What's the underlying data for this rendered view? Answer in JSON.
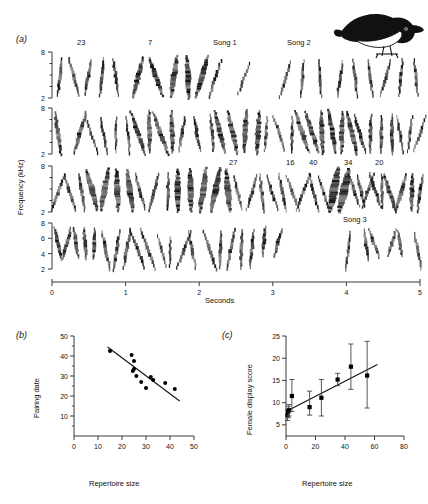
{
  "figure": {
    "panels": [
      {
        "key": "a",
        "label": "(a)"
      },
      {
        "key": "b",
        "label": "(b)"
      },
      {
        "key": "c",
        "label": "(c)"
      }
    ]
  },
  "panel_a": {
    "label": "(a)",
    "ylabel": "Frequency (kHz)",
    "xlabel": "Seconds",
    "x_ticks": [
      "0",
      "1",
      "2",
      "3",
      "4",
      "5"
    ],
    "xlim": [
      0,
      5
    ],
    "rows": [
      {
        "index": 1,
        "y_ticks": [
          "2",
          "8"
        ],
        "ylim": [
          2,
          8
        ]
      },
      {
        "index": 2,
        "y_ticks": [
          "2",
          "8"
        ],
        "ylim": [
          2,
          8
        ]
      },
      {
        "index": 3,
        "y_ticks": [
          "2",
          "8"
        ],
        "ylim": [
          2,
          8
        ]
      },
      {
        "index": 4,
        "y_ticks": [
          "2",
          "4",
          "6",
          "8"
        ],
        "ylim": [
          2,
          8
        ]
      }
    ],
    "song_labels_row1": [
      {
        "text": "23",
        "x": 83
      },
      {
        "text": "7",
        "x": 152
      },
      {
        "text": "Song 1",
        "x": 228
      },
      {
        "text": "Song 2",
        "x": 301
      }
    ],
    "song_labels_row3": [
      {
        "text": "27",
        "x": 233
      },
      {
        "text": "16",
        "x": 290
      },
      {
        "text": "40",
        "x": 313
      },
      {
        "text": "34",
        "x": 348
      },
      {
        "text": "20",
        "x": 379
      }
    ],
    "song_labels_row4": [
      {
        "text": "Song 3",
        "x": 350
      }
    ],
    "bird_icon": "perched-warbler-illustration"
  },
  "chart_data": [
    {
      "id": "panel_a_sonogram",
      "type": "heatmap",
      "title": "",
      "panel": "(a)",
      "xlabel": "Seconds",
      "ylabel": "Frequency (kHz)",
      "xlim": [
        0,
        5
      ],
      "ylim": [
        2,
        8
      ],
      "x_ticks": [
        0,
        1,
        2,
        3,
        4,
        5
      ],
      "y_ticks": [
        2,
        8
      ],
      "grid": false,
      "legend": "none",
      "description": "Four-row sonogram (spectrogram) strip of a continuously singing male warbler; each tick mark is one song syllable/element between 2 and 8 kHz.",
      "annotations": [
        {
          "row": 1,
          "text": "23"
        },
        {
          "row": 1,
          "text": "7"
        },
        {
          "row": 1,
          "text": "Song 1"
        },
        {
          "row": 1,
          "text": "Song 2"
        },
        {
          "row": 3,
          "text": "27"
        },
        {
          "row": 3,
          "text": "16"
        },
        {
          "row": 3,
          "text": "40"
        },
        {
          "row": 3,
          "text": "34"
        },
        {
          "row": 3,
          "text": "20"
        },
        {
          "row": 4,
          "text": "Song 3"
        }
      ]
    },
    {
      "id": "panel_b_pairing_date",
      "type": "scatter",
      "panel": "(b)",
      "title": "",
      "xlabel": "Repertoire size",
      "ylabel": "Pairing date",
      "xlim": [
        0,
        50
      ],
      "ylim": [
        0,
        50
      ],
      "x_ticks": [
        0,
        10,
        20,
        30,
        40,
        50
      ],
      "y_ticks": [
        10,
        20,
        30,
        40,
        50
      ],
      "grid": false,
      "legend": "none",
      "points": [
        {
          "x": 15,
          "y": 42.5
        },
        {
          "x": 24,
          "y": 40.5
        },
        {
          "x": 25,
          "y": 37.5
        },
        {
          "x": 25,
          "y": 33.5
        },
        {
          "x": 24.5,
          "y": 32.5
        },
        {
          "x": 26,
          "y": 30
        },
        {
          "x": 28,
          "y": 27
        },
        {
          "x": 30,
          "y": 24
        },
        {
          "x": 32,
          "y": 29.5
        },
        {
          "x": 33,
          "y": 28
        },
        {
          "x": 38,
          "y": 26.5
        },
        {
          "x": 42,
          "y": 23.5
        }
      ],
      "trendline": {
        "x": [
          14,
          44
        ],
        "y": [
          44.5,
          17.5
        ],
        "direction": "negative"
      }
    },
    {
      "id": "panel_c_female_display",
      "type": "scatter",
      "panel": "(c)",
      "title": "",
      "xlabel": "Repertoire size",
      "ylabel": "Female display score",
      "xlim": [
        0,
        80
      ],
      "ylim": [
        2.5,
        25
      ],
      "x_ticks": [
        0,
        20,
        40,
        60,
        80
      ],
      "y_ticks": [
        5,
        10,
        15,
        20,
        25
      ],
      "grid": false,
      "legend": "none",
      "error_bars": "vertical",
      "points": [
        {
          "x": 1,
          "y": 7.2,
          "err_low": 6.0,
          "err_high": 8.4
        },
        {
          "x": 1.5,
          "y": 8.0,
          "err_low": 6.6,
          "err_high": 9.2
        },
        {
          "x": 2,
          "y": 8.3,
          "err_low": 7.0,
          "err_high": 9.6
        },
        {
          "x": 4,
          "y": 11.5,
          "err_low": 8.0,
          "err_high": 15.2
        },
        {
          "x": 16,
          "y": 9.0,
          "err_low": 7.2,
          "err_high": 12.6
        },
        {
          "x": 24,
          "y": 11.1,
          "err_low": 7.0,
          "err_high": 15.2
        },
        {
          "x": 35,
          "y": 15.2,
          "err_low": 13.8,
          "err_high": 16.6
        },
        {
          "x": 44,
          "y": 18.1,
          "err_low": 13.0,
          "err_high": 23.2
        },
        {
          "x": 55,
          "y": 16.1,
          "err_low": 8.8,
          "err_high": 23.8
        }
      ],
      "trendline": {
        "x": [
          0,
          62
        ],
        "y": [
          8.0,
          18.6
        ],
        "direction": "positive"
      }
    }
  ],
  "panel_b": {
    "label": "(b)",
    "xlabel": "Repertoire size",
    "ylabel": "Pairing date"
  },
  "panel_c": {
    "label": "(c)",
    "xlabel": "Repertoire size",
    "ylabel": "Female display score"
  },
  "colors": {
    "ink": "#111111",
    "axis": "#222222",
    "marker": "#000000",
    "background": "#ffffff"
  }
}
